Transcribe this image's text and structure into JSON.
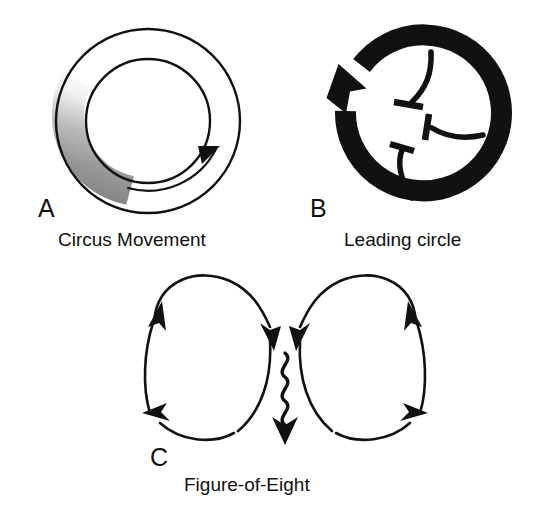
{
  "figure": {
    "background_color": "#ffffff",
    "ink_color": "#111111",
    "type": "scientific-diagram",
    "panels": [
      {
        "letter": "A",
        "caption": "Circus Movement",
        "shape": "annulus",
        "outer_radius": 92,
        "inner_radius": 62,
        "stroke_color": "#111111",
        "stroke_width": 2.2,
        "gradient": {
          "name": "refractory-gap-gradient",
          "from_color": "#ffffff",
          "to_color": "#7d7d7d",
          "arc_start_deg": 150,
          "arc_end_deg": 255
        },
        "direction_arrow": {
          "name": "clockwise-flow-arrow",
          "direction": "clockwise",
          "position": "inner-bottom"
        }
      },
      {
        "letter": "B",
        "caption": "Leading circle",
        "shape": "thick-ring-arrow",
        "ring_radius": 78,
        "ring_thickness": 20,
        "fill_color": "#111111",
        "rotation": "counterclockwise",
        "arrowhead_position": "upper-left",
        "gap_deg": 42,
        "wavelets": [
          {
            "name": "centripetal-wavelet-top",
            "origin_deg": 70,
            "block": "t-bar"
          },
          {
            "name": "centripetal-wavelet-right",
            "origin_deg": 0,
            "block": "t-bar"
          },
          {
            "name": "centripetal-wavelet-bottom",
            "origin_deg": 290,
            "block": "t-bar"
          }
        ]
      },
      {
        "letter": "C",
        "caption": "Figure-of-Eight",
        "shape": "dual-loop",
        "stroke_color": "#111111",
        "stroke_width": 2.4,
        "loops": [
          {
            "name": "left-loop",
            "rotation": "clockwise",
            "arrowheads": [
              "top-left-up",
              "bottom-left-out"
            ]
          },
          {
            "name": "right-loop",
            "rotation": "counterclockwise",
            "arrowheads": [
              "top-right-up",
              "bottom-right-out"
            ]
          }
        ],
        "common_pathway": {
          "name": "central-wavy-isthmus",
          "style": "sinusoidal",
          "wave_count": 5,
          "terminal_arrow": "down",
          "converging_arrows": 2
        }
      }
    ]
  }
}
